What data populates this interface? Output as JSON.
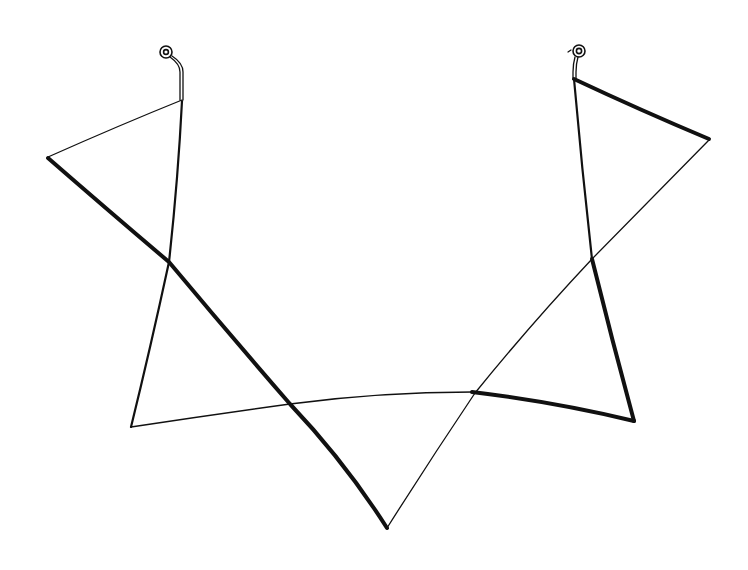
{
  "figure": {
    "background": "#ffffff",
    "ink_color": "#111111",
    "clasps": [
      {
        "name": "left-clasp",
        "ring_center": [
          166,
          52
        ],
        "hook_to": [
          182,
          100
        ]
      },
      {
        "name": "right-clasp",
        "ring_center": [
          578,
          51
        ],
        "hook_to": [
          574,
          78
        ]
      }
    ],
    "segments": [
      {
        "name": "left-top-diagonal",
        "weight": "thin",
        "points": [
          [
            182,
            100
          ],
          [
            48,
            157
          ]
        ]
      },
      {
        "name": "left-vertical",
        "weight": "mid",
        "points": [
          [
            182,
            100
          ],
          [
            177,
            170
          ],
          [
            169,
            262
          ],
          [
            131,
            427
          ]
        ]
      },
      {
        "name": "left-thick-diagonal",
        "weight": "thick",
        "points": [
          [
            48,
            158
          ],
          [
            169,
            262
          ],
          [
            290,
            404
          ],
          [
            340,
            460
          ],
          [
            387,
            528
          ]
        ]
      },
      {
        "name": "bottom-curve",
        "weight": "thin",
        "points": [
          [
            131,
            427
          ],
          [
            210,
            413
          ],
          [
            290,
            404
          ],
          [
            380,
            395
          ],
          [
            472,
            392
          ]
        ]
      },
      {
        "name": "right-thin-diagonal",
        "weight": "thin",
        "points": [
          [
            387,
            528
          ],
          [
            475,
            393
          ],
          [
            592,
            259
          ],
          [
            709,
            141
          ]
        ]
      },
      {
        "name": "right-top-thick",
        "weight": "thick",
        "points": [
          [
            574,
            78
          ],
          [
            709,
            139
          ]
        ]
      },
      {
        "name": "right-vertical",
        "weight": "mid",
        "points": [
          [
            574,
            78
          ],
          [
            582,
            160
          ],
          [
            592,
            259
          ]
        ]
      },
      {
        "name": "right-thick-vertical",
        "weight": "thick",
        "points": [
          [
            592,
            259
          ],
          [
            634,
            421
          ]
        ]
      },
      {
        "name": "right-thick-bottom",
        "weight": "thick",
        "points": [
          [
            472,
            392
          ],
          [
            560,
            405
          ],
          [
            634,
            421
          ]
        ]
      }
    ]
  }
}
